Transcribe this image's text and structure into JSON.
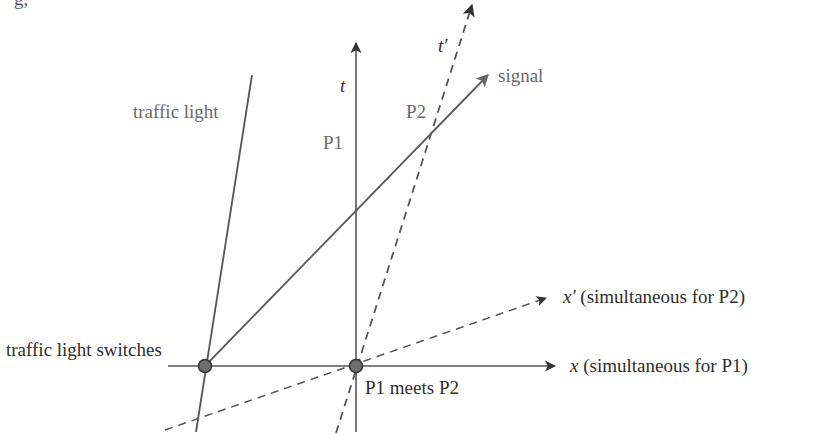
{
  "top_fragment": "g,",
  "axes": {
    "t": {
      "label": "t"
    },
    "x": {
      "label": "x",
      "suffix": " (simultaneous for P1)"
    },
    "t_prime": {
      "label": "t′"
    },
    "x_prime": {
      "label": "x′",
      "suffix": " (simultaneous for P2)"
    }
  },
  "worldlines": {
    "traffic_light": {
      "label": "traffic light"
    },
    "signal": {
      "label": "signal"
    }
  },
  "events": {
    "switch": {
      "label": "traffic light switches"
    },
    "meet": {
      "label": "P1 meets P2"
    },
    "p1": {
      "label": "P1"
    },
    "p2": {
      "label": "P2"
    }
  },
  "colors": {
    "axis": "#555555",
    "line": "#5a5a5a",
    "dashed": "#555555",
    "event_fill": "#6e6e6e",
    "event_stroke": "#333333",
    "label_dark": "#2e2e2e",
    "label_grey": "#6a6a6a"
  }
}
